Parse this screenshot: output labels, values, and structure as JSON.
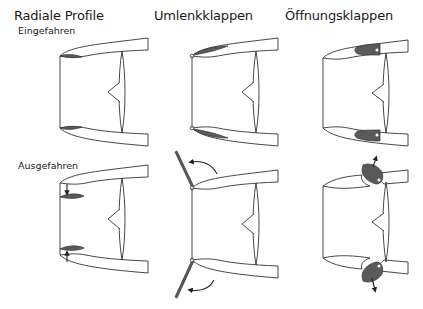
{
  "columns": [
    {
      "title": "Radiale Profile"
    },
    {
      "title": "Umlenkklappen"
    },
    {
      "title": "Öffnungsklappen"
    }
  ],
  "rows": [
    {
      "label": "Eingefahren"
    },
    {
      "label": "Ausgefahren"
    }
  ],
  "colors": {
    "outline": "#333333",
    "flap_fill": "#5a5a5a",
    "background": "#ffffff"
  }
}
